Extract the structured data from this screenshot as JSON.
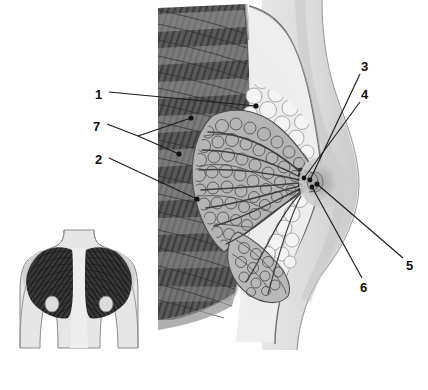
{
  "figure": {
    "background_color": "#ffffff"
  },
  "palette": {
    "page_background": "#ffffff",
    "body_fill": "#d9d9d9",
    "body_fill_deep": "#cfcfcf",
    "skin_line": "#6f6f6f",
    "fat_fill": "#ececec",
    "fat_lobule_line": "#9a9a9a",
    "gland_fill": "#b7b7b7",
    "gland_line": "#5b5b5b",
    "muscle_dark": "#4c4c4c",
    "muscle_mid": "#6b6b6b",
    "muscle_light": "#8e8e8e",
    "rib_fill": "#c9c9c9",
    "areola_fill": "#bdbdbd",
    "nipple_fill": "#a8a8a8",
    "duct_line": "#4a4a4a",
    "leader_line": "#1c1c1c",
    "label_text": "#101010",
    "inset_muscle": "#3a3a3a",
    "inset_body": "#e3e3e3",
    "inset_outline": "#8a8a8a"
  },
  "labels": [
    {
      "id": "1",
      "text": "1",
      "x": 95,
      "y": 94,
      "side": "left",
      "target_x": 256,
      "target_y": 105,
      "description": "adipose (fatty) tissue"
    },
    {
      "id": "7",
      "text": "7",
      "x": 93,
      "y": 126,
      "side": "left",
      "target_x": 190,
      "target_y": 118,
      "target2_x": 178,
      "target2_y": 153,
      "fork_x": 136,
      "fork_y": 135,
      "description": "pectoral / intercostal muscle layers"
    },
    {
      "id": "2",
      "text": "2",
      "x": 95,
      "y": 158,
      "side": "left",
      "target_x": 196,
      "target_y": 198,
      "description": "glandular lobules of the mammary gland"
    },
    {
      "id": "3",
      "text": "3",
      "x": 362,
      "y": 66,
      "side": "right",
      "target_x": 310,
      "target_y": 180,
      "description": "lactiferous ducts"
    },
    {
      "id": "4",
      "text": "4",
      "x": 362,
      "y": 94,
      "side": "right",
      "target_x": 304,
      "target_y": 178,
      "description": "lactiferous sinus"
    },
    {
      "id": "5",
      "text": "5",
      "x": 409,
      "y": 265,
      "side": "right",
      "target_x": 317,
      "target_y": 183,
      "description": "nipple"
    },
    {
      "id": "6",
      "text": "6",
      "x": 363,
      "y": 287,
      "side": "right",
      "target_x": 312,
      "target_y": 186,
      "description": "areola"
    }
  ],
  "main_view": {
    "name": "sagittal-breast-section",
    "regions": [
      {
        "name": "chest-wall-muscle",
        "label_ref": "7"
      },
      {
        "name": "adipose-tissue",
        "label_ref": "1"
      },
      {
        "name": "glandular-tissue",
        "label_ref": "2"
      },
      {
        "name": "lactiferous-ducts",
        "label_ref": "3"
      },
      {
        "name": "lactiferous-sinus",
        "label_ref": "4"
      },
      {
        "name": "nipple",
        "label_ref": "5"
      },
      {
        "name": "areola",
        "label_ref": "6"
      }
    ]
  },
  "inset_view": {
    "name": "anterior-torso-pectoral-muscles",
    "description": "Anterior view of the upper torso showing the pectoralis major muscles of both sides",
    "x": 10,
    "y": 228,
    "width": 135,
    "height": 125
  }
}
